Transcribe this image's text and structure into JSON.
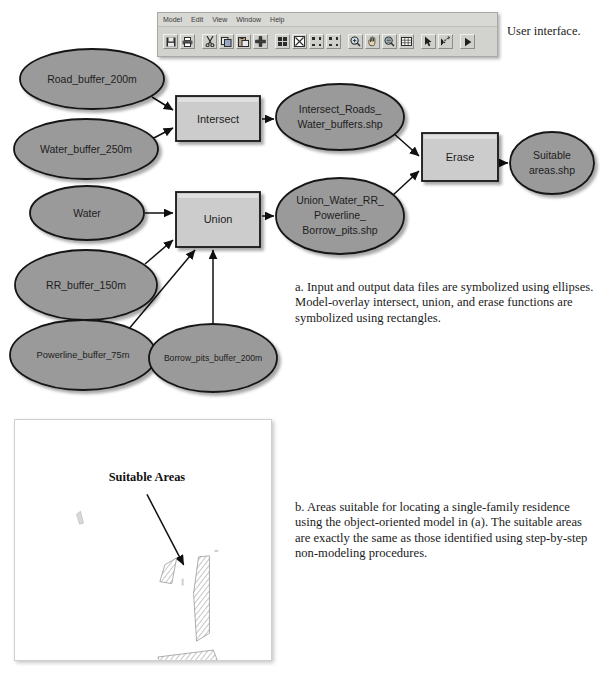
{
  "ui_window": {
    "caption": "User interface.",
    "menu": [
      {
        "label": "Model"
      },
      {
        "label": "Edit"
      },
      {
        "label": "View"
      },
      {
        "label": "Window"
      },
      {
        "label": "Help"
      }
    ],
    "toolbar": [
      {
        "icon": "save-icon"
      },
      {
        "icon": "print-icon"
      },
      {
        "icon": "cut-icon"
      },
      {
        "icon": "copy-icon"
      },
      {
        "icon": "paste-icon"
      },
      {
        "icon": "add-icon"
      },
      {
        "icon": "full-extent-icon"
      },
      {
        "icon": "fit-to-window-icon"
      },
      {
        "icon": "zoom-to-selection-icon"
      },
      {
        "icon": "expand-diagram-icon"
      },
      {
        "icon": "zoom-in-icon"
      },
      {
        "icon": "pan-icon"
      },
      {
        "icon": "zoom-out-icon"
      },
      {
        "icon": "grid-icon"
      },
      {
        "icon": "select-arrow-icon"
      },
      {
        "icon": "connect-icon"
      },
      {
        "icon": "run-icon"
      }
    ]
  },
  "diagram": {
    "type": "model-builder-flowchart",
    "inputs": [
      {
        "id": "road_buffer",
        "label": "Road_buffer_200m",
        "shape": "ellipse",
        "cx": 92,
        "cy": 79,
        "rx": 72,
        "ry": 30
      },
      {
        "id": "water_buffer",
        "label": "Water_buffer_250m",
        "shape": "ellipse",
        "cx": 86,
        "cy": 149,
        "rx": 72,
        "ry": 30
      },
      {
        "id": "water",
        "label": "Water",
        "shape": "ellipse",
        "cx": 87,
        "cy": 213,
        "rx": 57,
        "ry": 27
      },
      {
        "id": "rr_buffer",
        "label": "RR_buffer_150m",
        "shape": "ellipse",
        "cx": 86,
        "cy": 285,
        "rx": 71,
        "ry": 35
      },
      {
        "id": "powerline_buffer",
        "label": "Powerline_buffer_75m",
        "shape": "ellipse",
        "cx": 83,
        "cy": 355,
        "rx": 73,
        "ry": 35
      },
      {
        "id": "borrow_pits_buffer",
        "label": "Borrow_pits_buffer_200m",
        "shape": "ellipse",
        "cx": 213,
        "cy": 358,
        "rx": 64,
        "ry": 34
      }
    ],
    "processes": [
      {
        "id": "intersect",
        "label": "Intersect",
        "shape": "rectangle",
        "x": 176,
        "y": 96,
        "w": 84,
        "h": 45
      },
      {
        "id": "union",
        "label": "Union",
        "shape": "rectangle",
        "x": 176,
        "y": 192,
        "w": 84,
        "h": 55
      },
      {
        "id": "erase",
        "label": "Erase",
        "shape": "rectangle",
        "x": 422,
        "y": 133,
        "w": 76,
        "h": 48
      }
    ],
    "outputs": [
      {
        "id": "intersect_out",
        "label": [
          "Intersect_Roads_",
          "Water_buffers.shp"
        ],
        "shape": "ellipse",
        "cx": 340,
        "cy": 117,
        "rx": 64,
        "ry": 33
      },
      {
        "id": "union_out",
        "label": [
          "Union_Water_RR_",
          "Powerline_",
          "Borrow_pits.shp"
        ],
        "shape": "ellipse",
        "cx": 340,
        "cy": 216,
        "rx": 64,
        "ry": 38
      },
      {
        "id": "suitable_out",
        "label": [
          "Suitable",
          "areas.shp"
        ],
        "shape": "ellipse",
        "cx": 552,
        "cy": 163,
        "rx": 42,
        "ry": 31
      }
    ],
    "edges": [
      {
        "from": "road_buffer",
        "to": "intersect"
      },
      {
        "from": "water_buffer",
        "to": "intersect"
      },
      {
        "from": "intersect",
        "to": "intersect_out"
      },
      {
        "from": "water",
        "to": "union"
      },
      {
        "from": "rr_buffer",
        "to": "union"
      },
      {
        "from": "powerline_buffer",
        "to": "union"
      },
      {
        "from": "borrow_pits_buffer",
        "to": "union"
      },
      {
        "from": "union",
        "to": "union_out"
      },
      {
        "from": "intersect_out",
        "to": "erase"
      },
      {
        "from": "union_out",
        "to": "erase"
      },
      {
        "from": "erase",
        "to": "suitable_out"
      }
    ],
    "colors": {
      "ellipse_fill": "#9a9a9a",
      "rect_fill": "#cccccc",
      "stroke": "#1a1a1a"
    }
  },
  "captions": {
    "a": "a. Input and output data files are symbolized using ellipses. Model-overlay intersect, union, and erase functions are symbolized using rectangles.",
    "b": "b. Areas suitable for locating a single-family residence using the object-oriented model in (a). The suitable areas are exactly the same as those identified using step-by-step non-modeling procedures."
  },
  "map": {
    "title": "Suitable Areas",
    "annotation_arrow": {
      "from_x": 133,
      "from_y": 75,
      "to_x": 172,
      "to_y": 148
    },
    "polygons": [
      {
        "id": "poly-left",
        "points": "151,146 163,139 158,165 146,163"
      },
      {
        "id": "poly-main",
        "points": "185,138 196,137 196,215 183,223 180,175"
      },
      {
        "id": "poly-lower",
        "points": "144,239 200,232 206,242 150,250"
      },
      {
        "id": "poly-speck",
        "points": "62,95 66,92 69,103 65,104"
      }
    ]
  }
}
